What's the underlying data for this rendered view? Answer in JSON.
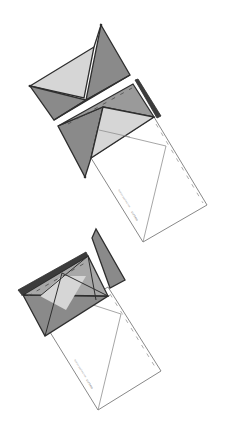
{
  "diagram": {
    "colors": {
      "background": "#ffffff",
      "outline": "#2e2e2e",
      "dark_fill": "#8a8a8a",
      "mid_fill": "#a8a8a8",
      "light_fill": "#d6d6d6",
      "paper": "#ffffff",
      "thin_line": "#8f8f8f"
    },
    "steps": [
      {
        "id": "step-1",
        "label": "Folded envelope"
      },
      {
        "id": "step-2",
        "label": "Unfolding top flap"
      },
      {
        "id": "step-3",
        "label": "Side flaps folded"
      }
    ],
    "paper_labels": {
      "small_text": "fold on dashed line",
      "tiny_text": "cut here"
    }
  }
}
